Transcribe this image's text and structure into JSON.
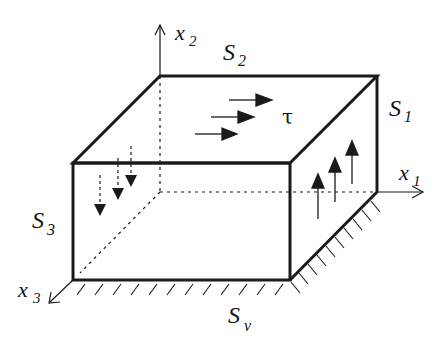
{
  "diagram": {
    "colors": {
      "stroke": "#1a1a1a",
      "background": "#ffffff"
    },
    "axes": {
      "x1": {
        "label": "x",
        "subscript": "1"
      },
      "x2": {
        "label": "x",
        "subscript": "2"
      },
      "x3": {
        "label": "x",
        "subscript": "3"
      }
    },
    "surfaces": {
      "S1": {
        "label": "S",
        "subscript": "1"
      },
      "S2": {
        "label": "S",
        "subscript": "2"
      },
      "S3": {
        "label": "S",
        "subscript": "3"
      },
      "Sv": {
        "label": "S",
        "subscript": "ν"
      }
    },
    "traction": {
      "symbol": "τ"
    },
    "arrows": {
      "top_face_count": 3,
      "right_face_count": 3,
      "front_face_count": 3
    }
  }
}
